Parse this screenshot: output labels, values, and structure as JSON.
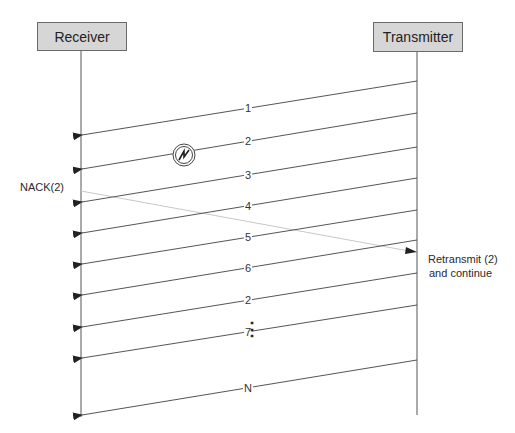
{
  "participants": {
    "receiver": {
      "label": "Receiver",
      "x": 81
    },
    "transmitter": {
      "label": "Transmitter",
      "x": 417
    }
  },
  "messages": [
    {
      "label": "1",
      "from_y": 81,
      "to_y": 135
    },
    {
      "label": "2",
      "from_y": 113,
      "to_y": 169,
      "lost": true
    },
    {
      "label": "3",
      "from_y": 147,
      "to_y": 202
    },
    {
      "label": "4",
      "from_y": 178,
      "to_y": 233
    },
    {
      "label": "5",
      "from_y": 210,
      "to_y": 264
    },
    {
      "label": "6",
      "from_y": 240,
      "to_y": 295
    },
    {
      "label": "2",
      "from_y": 273,
      "to_y": 327
    },
    {
      "label": "7",
      "from_y": 305,
      "to_y": 358
    },
    {
      "label": "N",
      "from_y": 360,
      "to_y": 415
    }
  ],
  "ellipsis": {
    "label": "⋮"
  },
  "nack": {
    "label": "NACK(2)",
    "from_y": 191,
    "to_y": 252,
    "color": "#c8c8c8"
  },
  "retransmit_note": {
    "line1": "Retransmit (2)",
    "line2": "and continue"
  },
  "error_icon": {
    "name": "lightning-error-icon",
    "cx": 184,
    "cy": 155
  },
  "colors": {
    "box_fill": "#d6d6d6",
    "line": "#555555",
    "nack_line": "#c8c8c8"
  }
}
